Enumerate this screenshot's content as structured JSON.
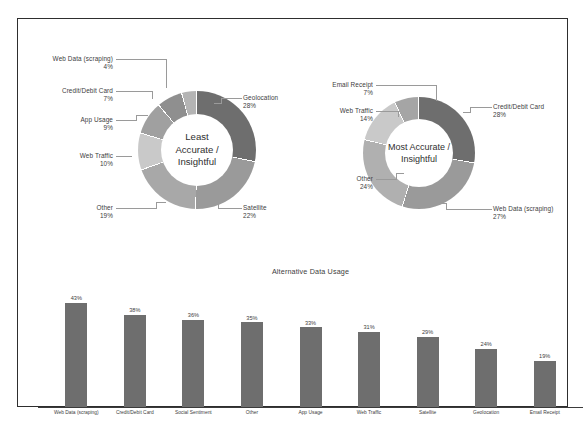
{
  "slide": {
    "background": "#ffffff",
    "border_color": "#2e2e2e"
  },
  "palette": {
    "dark_gray": "#6e6e6e",
    "mid_gray": "#8f8f8f",
    "light_gray": "#b4b4b4",
    "lighter_gray": "#c9c9c9",
    "pale_gray": "#dcdcdc",
    "bar_fill": "#6e6e6e",
    "leader_line": "#9a9a9a",
    "text": "#404040"
  },
  "donut_left": {
    "center_line1": "Least",
    "center_line2": "Accurate /",
    "center_line3": "Insightful",
    "labels": {
      "web_data_name": "Web Data (scraping)",
      "web_data_pct": "4%",
      "credit_name": "Credit/Debit Card",
      "credit_pct": "7%",
      "app_usage_name": "App Usage",
      "app_usage_pct": "9%",
      "web_traffic_name": "Web Traffic",
      "web_traffic_pct": "10%",
      "other_name": "Other",
      "other_pct": "19%",
      "satellite_name": "Satellite",
      "satellite_pct": "22%",
      "geolocation_name": "Geolocation",
      "geolocation_pct": "28%"
    }
  },
  "donut_right": {
    "center_line1": "Most Accurate /",
    "center_line2": "Insightful",
    "labels": {
      "email_name": "Email Receipt",
      "email_pct": "7%",
      "web_traffic_name": "Web Traffic",
      "web_traffic_pct": "14%",
      "other_name": "Other",
      "other_pct": "24%",
      "credit_name": "Credit/Debit Card",
      "credit_pct": "28%",
      "web_data_name": "Web Data (scraping)",
      "web_data_pct": "27%"
    }
  },
  "bar_chart": {
    "title": "Alternative Data Usage"
  },
  "chart_data": [
    {
      "type": "pie",
      "title": "Least Accurate / Insightful",
      "center_label": "Least Accurate / Insightful",
      "legend_position": "callout-labels",
      "labels": [
        "Geolocation",
        "Satellite",
        "Other",
        "Web Traffic",
        "App Usage",
        "Credit/Debit Card",
        "Web Data (scraping)"
      ],
      "values": [
        28,
        22,
        19,
        10,
        9,
        7,
        4
      ],
      "value_labels": [
        "28%",
        "22%",
        "19%",
        "10%",
        "9%",
        "7%",
        "4%"
      ],
      "colors": [
        "#6e6e6e",
        "#9a9a9a",
        "#a8a8a8",
        "#c9c9c9",
        "#a0a0a0",
        "#8f8f8f",
        "#b4b4b4"
      ]
    },
    {
      "type": "pie",
      "title": "Most Accurate / Insightful",
      "center_label": "Most Accurate / Insightful",
      "legend_position": "callout-labels",
      "labels": [
        "Credit/Debit Card",
        "Web Data (scraping)",
        "Other",
        "Web Traffic",
        "Email Receipt"
      ],
      "values": [
        28,
        27,
        24,
        14,
        7
      ],
      "value_labels": [
        "28%",
        "27%",
        "24%",
        "14%",
        "7%"
      ],
      "colors": [
        "#6e6e6e",
        "#9a9a9a",
        "#b0b0b0",
        "#c9c9c9",
        "#a5a5a5"
      ]
    },
    {
      "type": "bar",
      "title": "Alternative Data Usage",
      "xlabel": "",
      "ylabel": "",
      "ylim": [
        0,
        50
      ],
      "grid": false,
      "categories": [
        "Web Data (scraping)",
        "Credit/Debit Card",
        "Social Sentiment",
        "Other",
        "App Usage",
        "Web Traffic",
        "Satellite",
        "Geolocation",
        "Email Receipt"
      ],
      "values": [
        43,
        38,
        36,
        35,
        33,
        31,
        29,
        24,
        19
      ],
      "value_labels": [
        "43%",
        "38%",
        "36%",
        "35%",
        "33%",
        "31%",
        "29%",
        "24%",
        "19%"
      ]
    }
  ]
}
